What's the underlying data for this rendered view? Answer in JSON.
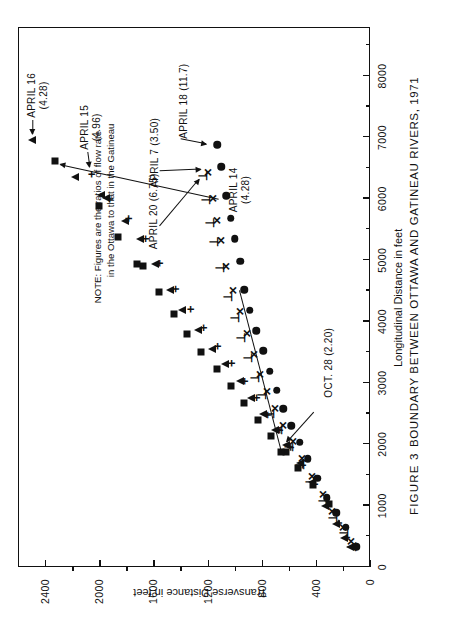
{
  "figure": {
    "number_label": "FIGURE  3",
    "caption": "BOUNDARY  BETWEEN  OTTAWA  AND  GATINEAU  RIVERS,  1971"
  },
  "note": {
    "line1": "NOTE:  Figures are the ratios of flow rate",
    "line2": "in the Ottawa to that in the Gatineau"
  },
  "annotations": [
    {
      "id": "april-16",
      "line1": "APRIL 16",
      "line2": "(4.28)"
    },
    {
      "id": "april-15",
      "line1": "APRIL 15",
      "line2": "(4.96)"
    },
    {
      "id": "april-14",
      "line1": "APRIL 14",
      "line2": "(4.28)"
    },
    {
      "id": "april-20",
      "line1": "APRIL 20 (6.75)",
      "line2": ""
    },
    {
      "id": "april-7",
      "line1": "APRIL 7 (3.50)",
      "line2": ""
    },
    {
      "id": "april-18",
      "line1": "APRIL 18 (11.7)",
      "line2": ""
    },
    {
      "id": "oct-28",
      "line1": "OCT. 28 (2.20)",
      "line2": ""
    }
  ],
  "chart_data": {
    "type": "scatter",
    "title": "BOUNDARY  BETWEEN  OTTAWA  AND  GATINEAU  RIVERS,  1971",
    "subtitle": "FIGURE  3",
    "xlabel": "Longitudinal Distance in feet",
    "ylabel": "Transverse Distance in feet",
    "xlim": [
      0,
      8800
    ],
    "ylim": [
      0,
      2600
    ],
    "xticks": [
      0,
      1000,
      2000,
      3000,
      4000,
      5000,
      6000,
      7000,
      8000
    ],
    "xticklabels": [
      "0",
      "1000",
      "2000",
      "3000",
      "4000",
      "5000",
      "6000",
      "7000",
      "8000"
    ],
    "xminor": [
      500,
      1500,
      2500,
      3500,
      4500,
      5500,
      6500,
      7500,
      8500
    ],
    "yticks": [
      0,
      400,
      800,
      1200,
      1600,
      2000,
      2400
    ],
    "yticklabels": [
      "0",
      "400",
      "800",
      "1200",
      "1600",
      "2000",
      "2400"
    ],
    "yminor": [
      200,
      600,
      1000,
      1400,
      1800,
      2200
    ],
    "grid": false,
    "legend": "none",
    "note": "NOTE: Figures are the ratios of flow rate in the Ottawa to that in the Gatineau",
    "series": [
      {
        "name": "APRIL 16 (4.28)",
        "marker": "triangle",
        "ratio": 4.28,
        "points": [
          [
            330,
            150
          ],
          [
            480,
            195
          ],
          [
            700,
            250
          ],
          [
            1000,
            330
          ],
          [
            1380,
            430
          ],
          [
            1700,
            520
          ],
          [
            1980,
            620
          ],
          [
            2230,
            700
          ],
          [
            2500,
            790
          ],
          [
            2760,
            880
          ],
          [
            3030,
            960
          ],
          [
            3300,
            1070
          ],
          [
            3560,
            1170
          ],
          [
            3870,
            1270
          ],
          [
            4190,
            1390
          ],
          [
            4520,
            1480
          ],
          [
            4940,
            1590
          ],
          [
            5340,
            1700
          ],
          [
            5640,
            1810
          ],
          [
            6010,
            1950
          ],
          [
            6060,
            1990
          ],
          [
            6360,
            2180
          ],
          [
            6960,
            2500
          ]
        ]
      },
      {
        "name": "APRIL 15 (4.96)",
        "marker": "plus",
        "ratio": 4.96,
        "points": [
          [
            480,
            175
          ],
          [
            720,
            240
          ],
          [
            1000,
            315
          ],
          [
            1350,
            410
          ],
          [
            1660,
            500
          ],
          [
            1950,
            590
          ],
          [
            2230,
            670
          ],
          [
            2480,
            760
          ],
          [
            2760,
            840
          ],
          [
            3030,
            930
          ],
          [
            3320,
            1030
          ],
          [
            3600,
            1130
          ],
          [
            3900,
            1230
          ],
          [
            4200,
            1330
          ],
          [
            4530,
            1440
          ],
          [
            4950,
            1560
          ],
          [
            5350,
            1660
          ],
          [
            5680,
            1790
          ],
          [
            6000,
            1930
          ],
          [
            6400,
            2060
          ]
        ]
      },
      {
        "name": "APRIL 14 (4.28)",
        "marker": "square",
        "ratio": 4.28,
        "points": [
          [
            1020,
            300
          ],
          [
            1340,
            420
          ],
          [
            1620,
            530
          ],
          [
            1870,
            620
          ],
          [
            1870,
            660
          ],
          [
            2130,
            730
          ],
          [
            2400,
            830
          ],
          [
            2680,
            930
          ],
          [
            2950,
            1030
          ],
          [
            3220,
            1130
          ],
          [
            3500,
            1250
          ],
          [
            3800,
            1350
          ],
          [
            4130,
            1450
          ],
          [
            4480,
            1560
          ],
          [
            4900,
            1680
          ],
          [
            4940,
            1720
          ],
          [
            5380,
            1860
          ],
          [
            5880,
            2000
          ],
          [
            6620,
            2330
          ]
        ]
      },
      {
        "name": "APRIL 20 (6.75)",
        "marker": "tee",
        "ratio": 6.75,
        "points": [
          [
            330,
            130
          ],
          [
            560,
            195
          ],
          [
            800,
            270
          ],
          [
            1070,
            350
          ],
          [
            1380,
            440
          ],
          [
            1670,
            520
          ],
          [
            1950,
            600
          ],
          [
            2230,
            680
          ],
          [
            2500,
            740
          ],
          [
            2800,
            800
          ],
          [
            3080,
            850
          ],
          [
            3400,
            900
          ],
          [
            3740,
            950
          ],
          [
            4050,
            1000
          ],
          [
            4400,
            1050
          ],
          [
            4880,
            1110
          ],
          [
            5300,
            1150
          ],
          [
            5600,
            1180
          ],
          [
            5980,
            1210
          ],
          [
            6380,
            1230
          ]
        ]
      },
      {
        "name": "APRIL 7 (3.50)",
        "marker": "x",
        "ratio": 3.5,
        "points": [
          [
            420,
            140
          ],
          [
            640,
            200
          ],
          [
            900,
            280
          ],
          [
            1180,
            350
          ],
          [
            1480,
            430
          ],
          [
            1770,
            500
          ],
          [
            2040,
            570
          ],
          [
            2300,
            640
          ],
          [
            2580,
            700
          ],
          [
            2860,
            760
          ],
          [
            3130,
            810
          ],
          [
            3470,
            860
          ],
          [
            3800,
            910
          ],
          [
            4160,
            960
          ],
          [
            4500,
            1010
          ],
          [
            4900,
            1060
          ],
          [
            5320,
            1100
          ],
          [
            5640,
            1130
          ],
          [
            6000,
            1160
          ],
          [
            6430,
            1200
          ]
        ]
      },
      {
        "name": "APRIL 18 (11.7)",
        "marker": "circle",
        "ratio": 11.7,
        "points": [
          [
            330,
            100
          ],
          [
            650,
            180
          ],
          [
            880,
            250
          ],
          [
            1130,
            320
          ],
          [
            1450,
            390
          ],
          [
            1760,
            460
          ],
          [
            2030,
            520
          ],
          [
            2300,
            580
          ],
          [
            2580,
            640
          ],
          [
            2880,
            690
          ],
          [
            3190,
            740
          ],
          [
            3520,
            790
          ],
          [
            3850,
            840
          ],
          [
            4180,
            890
          ],
          [
            4520,
            930
          ],
          [
            4980,
            960
          ],
          [
            5350,
            1000
          ],
          [
            5680,
            1030
          ],
          [
            6050,
            1060
          ],
          [
            6520,
            1100
          ],
          [
            6880,
            1130
          ]
        ]
      },
      {
        "name": "OCT. 28 (2.20)",
        "marker": "line",
        "ratio": 2.2,
        "fit_line": [
          [
            1870,
            660
          ],
          [
            4500,
            970
          ]
        ]
      }
    ]
  }
}
